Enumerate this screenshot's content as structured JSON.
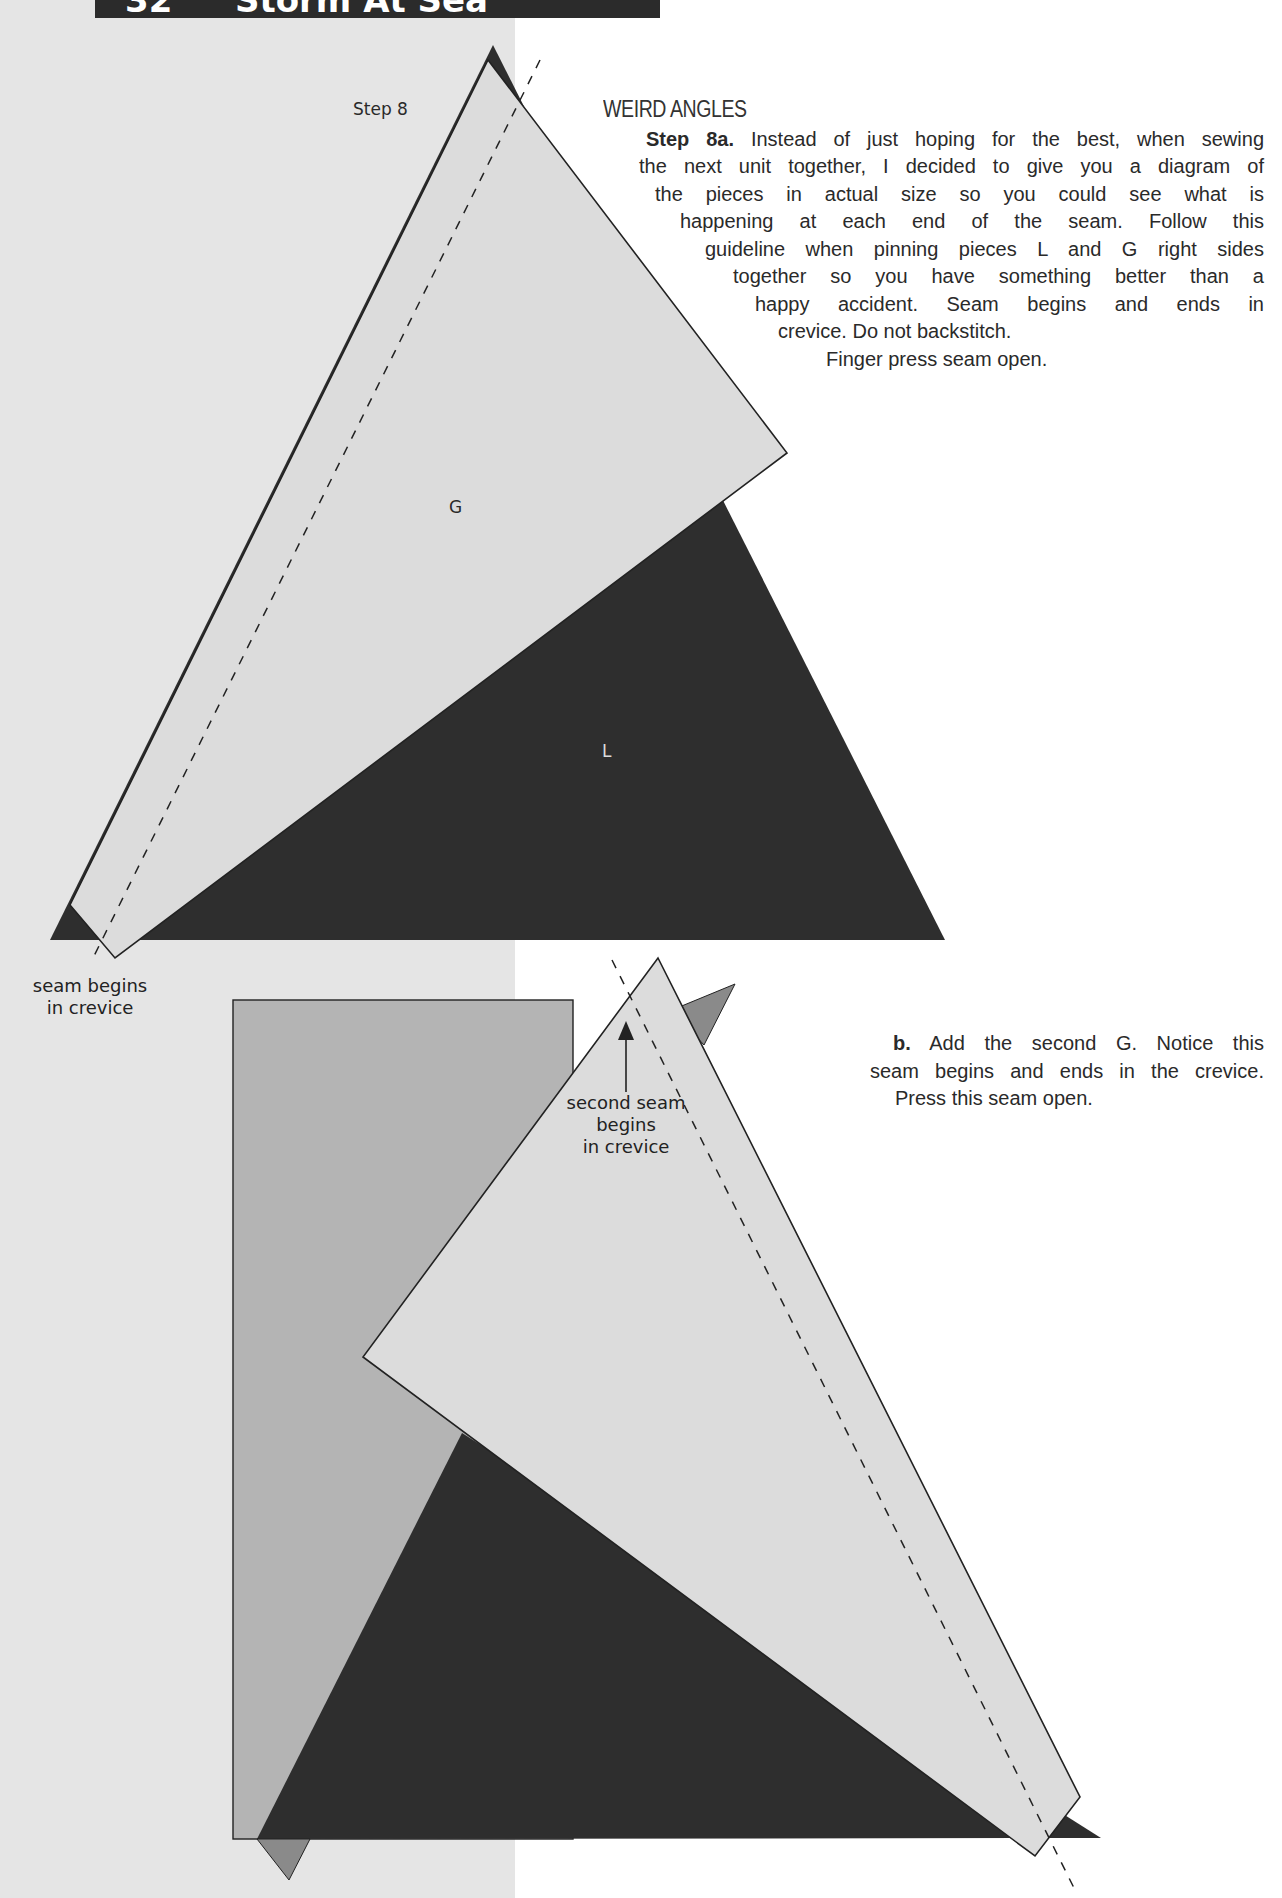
{
  "header": {
    "page_number": "32",
    "title": "Storm At Sea"
  },
  "colors": {
    "background_left_band": "#e5e5e5",
    "background_right": "#ffffff",
    "header_bar": "#2b2b2b",
    "piece_G_light": "#dcdcdc",
    "piece_L_dark": "#2e2e2e",
    "rectangle_medium": "#b4b4b4",
    "small_triangle_medium": "#8a8a8a",
    "outline": "#222222"
  },
  "diagram_a": {
    "step_label": "Step 8",
    "piece_G_label": "G",
    "piece_L_label": "L",
    "callout": [
      "seam begins",
      "in crevice"
    ]
  },
  "diagram_b": {
    "callout": [
      "second seam",
      "begins",
      "in crevice"
    ]
  },
  "section": {
    "heading": "WEIRD ANGLES",
    "step_a": {
      "lead": "Step 8a.",
      "lines": [
        " Instead of just hoping for the best, when sewing",
        "the next unit together, I decided to give you a diagram of",
        "the pieces in actual size so you could see what is",
        "happening at each end of the seam. Follow this",
        "guideline  when pinning pieces L and G right sides",
        "together so you have something better than a",
        "happy accident. Seam begins and ends in",
        "crevice. Do not backstitch.",
        "Finger press seam open."
      ]
    },
    "step_b": {
      "lead": "b.",
      "lines": [
        " Add the second G. Notice this",
        "seam begins and ends in the crevice.",
        "Press this seam open."
      ]
    }
  }
}
